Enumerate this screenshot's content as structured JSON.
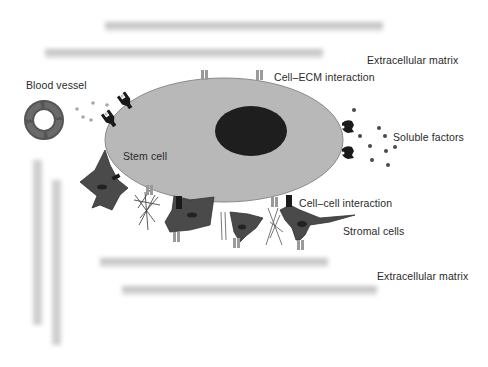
{
  "diagram": {
    "labels": {
      "ecm_top": "Extracellular matrix",
      "cell_ecm": "Cell–ECM interaction",
      "blood_vessel": "Blood vessel",
      "soluble_factors": "Soluble factors",
      "stem_cell": "Stem cell",
      "cell_cell": "Cell–cell interaction",
      "stromal_cells": "Stromal cells",
      "ecm_bottom": "Extracellular matrix"
    },
    "colors": {
      "stem_cell_fill": "#b8b8b8",
      "stem_cell_stroke": "#7a7a7a",
      "nucleus": "#1e1e1e",
      "stromal_cell": "#4a4a4a",
      "ecm_fiber": "#c4c4c4",
      "integrin": "#9a9a9a",
      "receptor": "#1a1a1a",
      "factor_dot_right": "#4a4a4a",
      "factor_dot_left": "#a8a8a8",
      "text": "#2a2a2a"
    }
  }
}
